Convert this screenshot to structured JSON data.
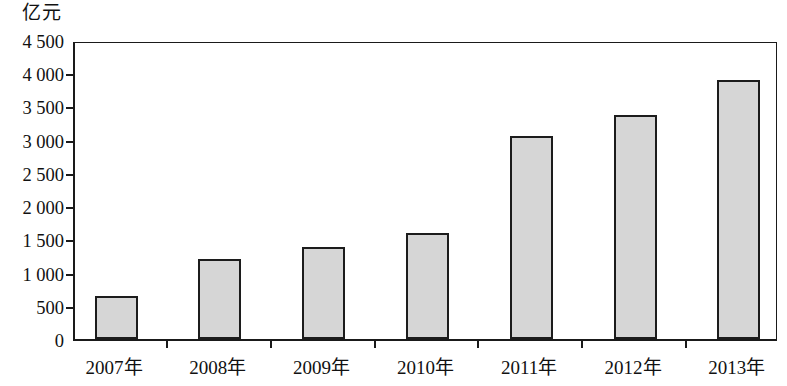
{
  "chart_data": {
    "type": "bar",
    "title": "",
    "subtitle": "",
    "unit_label": "亿元",
    "xlabel": "",
    "ylabel": "亿元",
    "grid": false,
    "legend": null,
    "ylim": [
      0,
      4500
    ],
    "ytick_step": 500,
    "ytick_labels": [
      "4 500",
      "4 000",
      "3 500",
      "3 000",
      "2 500",
      "2 000",
      "1 500",
      "1 000",
      "500",
      "0"
    ],
    "ytick_values": [
      4500,
      4000,
      3500,
      3000,
      2500,
      2000,
      1500,
      1000,
      500,
      0
    ],
    "categories": [
      "2007年",
      "2008年",
      "2009年",
      "2010年",
      "2011年",
      "2012年",
      "2013年"
    ],
    "values": [
      650,
      1200,
      1390,
      1590,
      3050,
      3370,
      3900
    ],
    "bar_fill_color": "#d6d6d6",
    "bar_border_color": "#1c1c1c",
    "axis_color": "#1a1a1a"
  }
}
